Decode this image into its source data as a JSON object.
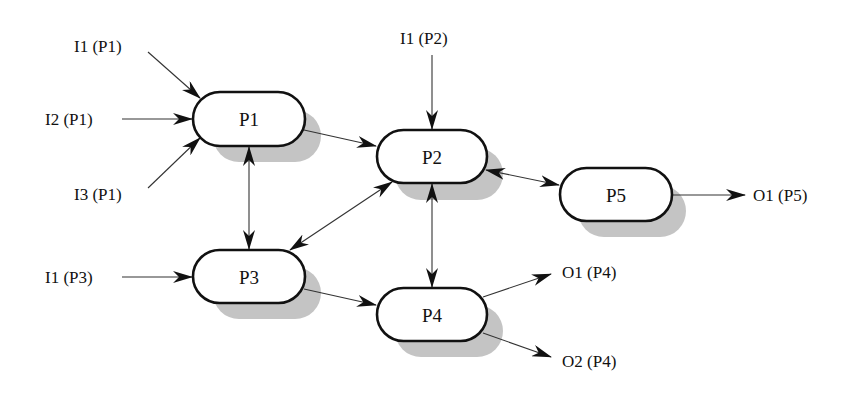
{
  "diagram": {
    "type": "process-flow",
    "nodes": [
      {
        "id": "P1",
        "label": "P1"
      },
      {
        "id": "P2",
        "label": "P2"
      },
      {
        "id": "P3",
        "label": "P3"
      },
      {
        "id": "P4",
        "label": "P4"
      },
      {
        "id": "P5",
        "label": "P5"
      }
    ],
    "inputs": [
      {
        "id": "I1_P1",
        "label": "I1 (P1)",
        "target": "P1"
      },
      {
        "id": "I2_P1",
        "label": "I2 (P1)",
        "target": "P1"
      },
      {
        "id": "I3_P1",
        "label": "I3 (P1)",
        "target": "P1"
      },
      {
        "id": "I1_P2",
        "label": "I1 (P2)",
        "target": "P2"
      },
      {
        "id": "I1_P3",
        "label": "I1 (P3)",
        "target": "P3"
      }
    ],
    "outputs": [
      {
        "id": "O1_P5",
        "label": "O1 (P5)",
        "source": "P5"
      },
      {
        "id": "O1_P4",
        "label": "O1 (P4)",
        "source": "P4"
      },
      {
        "id": "O2_P4",
        "label": "O2 (P4)",
        "source": "P4"
      }
    ],
    "edges": [
      {
        "from": "P1",
        "to": "P2",
        "direction": "one-way"
      },
      {
        "from": "P1",
        "to": "P3",
        "direction": "bidirectional"
      },
      {
        "from": "P2",
        "to": "P3",
        "direction": "bidirectional"
      },
      {
        "from": "P2",
        "to": "P5",
        "direction": "bidirectional"
      },
      {
        "from": "P2",
        "to": "P4",
        "direction": "bidirectional"
      },
      {
        "from": "P3",
        "to": "P4",
        "direction": "one-way"
      }
    ]
  }
}
